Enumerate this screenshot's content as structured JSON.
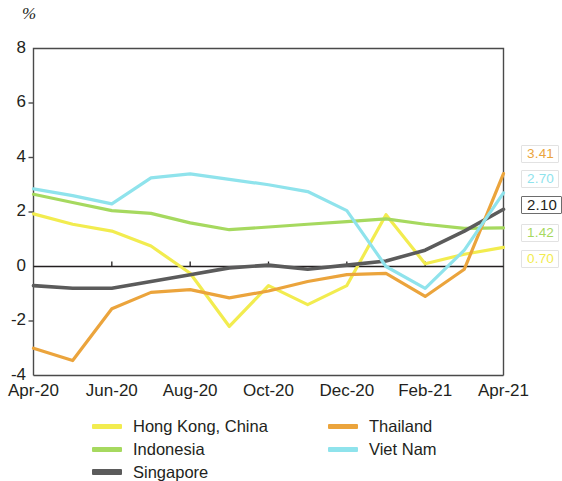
{
  "chart_data": {
    "type": "line",
    "title": "",
    "subtitle": "",
    "xlabel": "",
    "ylabel": "%",
    "unit_label": "%",
    "ylim": [
      -4,
      8
    ],
    "yticks": [
      8,
      6,
      4,
      2,
      0,
      -2,
      -4
    ],
    "ytick_labels": [
      "8",
      "6",
      "4",
      "2",
      "0",
      "-2",
      "-4"
    ],
    "xtick_labels": [
      "Apr-20",
      "Jun-20",
      "Aug-20",
      "Oct-20",
      "Dec-20",
      "Feb-21",
      "Apr-21"
    ],
    "x": [
      "Apr-20",
      "May-20",
      "Jun-20",
      "Jul-20",
      "Aug-20",
      "Sep-20",
      "Oct-20",
      "Nov-20",
      "Dec-20",
      "Jan-21",
      "Feb-21",
      "Mar-21",
      "Apr-21"
    ],
    "grid": false,
    "zero_line": true,
    "legend_position": "bottom",
    "series": [
      {
        "name": "Hong Kong, China",
        "color": "#f2ec4f",
        "end_label": "0.70",
        "values": [
          1.93,
          1.55,
          1.3,
          0.75,
          -0.25,
          -2.2,
          -0.7,
          -1.4,
          -0.7,
          1.9,
          0.1,
          0.45,
          0.7
        ]
      },
      {
        "name": "Indonesia",
        "color": "#a6d95f",
        "end_label": "1.42",
        "values": [
          2.65,
          2.35,
          2.05,
          1.95,
          1.6,
          1.35,
          1.45,
          1.55,
          1.65,
          1.75,
          1.55,
          1.4,
          1.42
        ]
      },
      {
        "name": "Singapore",
        "color": "#5b5b5b",
        "end_label": "2.10",
        "values": [
          -0.7,
          -0.8,
          -0.8,
          -0.55,
          -0.3,
          -0.05,
          0.05,
          -0.1,
          0.05,
          0.2,
          0.6,
          1.3,
          2.1
        ]
      },
      {
        "name": "Thailand",
        "color": "#eba43c",
        "end_label": "3.41",
        "values": [
          -3.0,
          -3.45,
          -1.55,
          -0.95,
          -0.85,
          -1.15,
          -0.9,
          -0.55,
          -0.3,
          -0.25,
          -1.1,
          -0.1,
          3.41
        ]
      },
      {
        "name": "Viet Nam",
        "color": "#8fe3ec",
        "end_label": "2.70",
        "values": [
          2.85,
          2.6,
          2.3,
          3.25,
          3.4,
          3.2,
          3.0,
          2.75,
          2.05,
          0.0,
          -0.8,
          0.6,
          2.7
        ]
      }
    ]
  },
  "legend": {
    "columns": [
      [
        {
          "label": "Hong Kong, China",
          "color": "#f2ec4f"
        },
        {
          "label": "Indonesia",
          "color": "#a6d95f"
        },
        {
          "label": "Singapore",
          "color": "#5b5b5b"
        }
      ],
      [
        {
          "label": "Thailand",
          "color": "#eba43c"
        },
        {
          "label": "Viet Nam",
          "color": "#8fe3ec"
        }
      ]
    ]
  }
}
